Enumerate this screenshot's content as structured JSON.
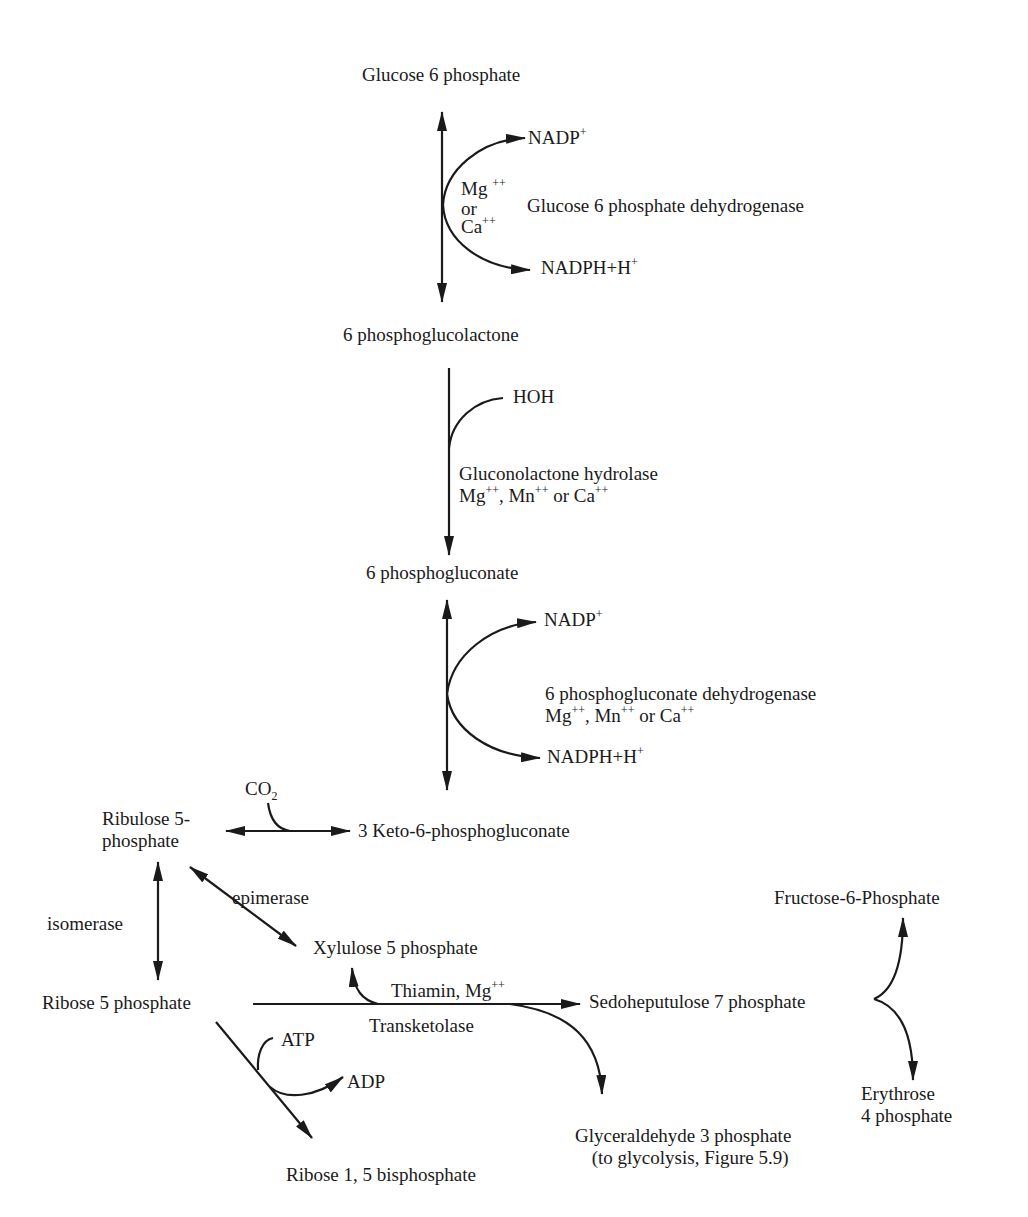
{
  "diagram": {
    "compounds": {
      "g6p": "Glucose 6 phosphate",
      "pgl": "6 phosphoglucolactone",
      "pg": "6 phosphogluconate",
      "keto": "3 Keto-6-phosphogluconate",
      "ru5p_l1": "Ribulose 5-",
      "ru5p_l2": "phosphate",
      "r5p": "Ribose 5 phosphate",
      "xu5p": "Xylulose 5 phosphate",
      "s7p": "Sedoheputulose 7 phosphate",
      "f6p": "Fructose-6-Phosphate",
      "e4p_l1": "Erythrose",
      "e4p_l2": "4 phosphate",
      "gap_l1": "Glyceraldehyde 3 phosphate",
      "gap_l2": "(to glycolysis, Figure 5.9)",
      "r15bp": "Ribose 1, 5 bisphosphate"
    },
    "cofactors": {
      "nadp_1": "NADP",
      "nadp_1_sup": "+",
      "nadph_1": "NADPH+H",
      "nadph_1_sup": "+",
      "mg_1": "Mg",
      "mg_1_sup": "++",
      "or_1": "or",
      "ca_1": "Ca",
      "ca_1_sup": "++",
      "hoh": "HOH",
      "nadp_2": "NADP",
      "nadp_2_sup": "+",
      "nadph_2": "NADPH+H",
      "nadph_2_sup": "+",
      "co2": "CO",
      "co2_sub": "2",
      "atp": "ATP",
      "adp": "ADP",
      "thiamin": "Thiamin, Mg",
      "thiamin_sup": "++"
    },
    "enzymes": {
      "g6pd": "Glucose 6 phosphate dehydrogenase",
      "hydrolase": "Gluconolactone hydrolase",
      "hydrolase_ions": {
        "mg": "Mg",
        "mg_sup": "++",
        "mn": ", Mn",
        "mn_sup": "++",
        "ca": " or Ca",
        "ca_sup": "++"
      },
      "pgd": "6 phosphogluconate dehydrogenase",
      "pgd_ions": {
        "mg": "Mg",
        "mg_sup": "++",
        "mn": ", Mn",
        "mn_sup": "++",
        "ca": " or Ca",
        "ca_sup": "++"
      },
      "epimerase": "epimerase",
      "isomerase": "isomerase",
      "transketolase": "Transketolase"
    },
    "colors": {
      "ink": "#1a1a1a",
      "background": "#ffffff"
    }
  }
}
